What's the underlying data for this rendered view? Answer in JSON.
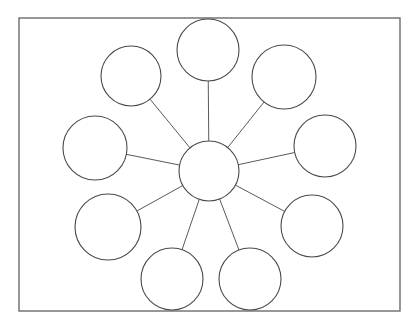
{
  "canvas": {
    "width": 417,
    "height": 325,
    "background_color": "#ffffff"
  },
  "frame": {
    "label": "worksheet-border",
    "x": 19,
    "y": 18,
    "width": 381,
    "height": 293,
    "stroke_color": "#6b6b6b",
    "stroke_width": 1.4,
    "fill": "none"
  },
  "style": {
    "circle_stroke_color": "#4a4a4a",
    "circle_stroke_width": 1.1,
    "circle_fill": "#ffffff",
    "line_stroke_color": "#5a5a5a",
    "line_stroke_width": 1.0
  },
  "diagram": {
    "type": "spider-web-concept-map",
    "title": "",
    "center_node": {
      "id": "center",
      "label": "",
      "cx": 209,
      "cy": 171,
      "r": 30
    },
    "outer_nodes": [
      {
        "id": "node-top",
        "label": "",
        "cx": 208,
        "cy": 50,
        "r": 31,
        "angle_deg": 270
      },
      {
        "id": "node-top-right",
        "label": "",
        "cx": 284,
        "cy": 77,
        "r": 32,
        "angle_deg": 317
      },
      {
        "id": "node-right",
        "label": "",
        "cx": 325,
        "cy": 146,
        "r": 31,
        "angle_deg": 349
      },
      {
        "id": "node-bottom-right",
        "label": "",
        "cx": 312,
        "cy": 226,
        "r": 31,
        "angle_deg": 29
      },
      {
        "id": "node-bottom-right-inner",
        "label": "",
        "cx": 250,
        "cy": 279,
        "r": 31,
        "angle_deg": 70
      },
      {
        "id": "node-bottom-left-inner",
        "label": "",
        "cx": 172,
        "cy": 279,
        "r": 31,
        "angle_deg": 110
      },
      {
        "id": "node-bottom-left",
        "label": "",
        "cx": 108,
        "cy": 227,
        "r": 33,
        "angle_deg": 151
      },
      {
        "id": "node-left",
        "label": "",
        "cx": 95,
        "cy": 148,
        "r": 32,
        "angle_deg": 192
      },
      {
        "id": "node-top-left",
        "label": "",
        "cx": 131,
        "cy": 76,
        "r": 30,
        "angle_deg": 232
      }
    ],
    "connections": [
      {
        "from": "center",
        "to": "node-top"
      },
      {
        "from": "center",
        "to": "node-top-right"
      },
      {
        "from": "center",
        "to": "node-right"
      },
      {
        "from": "center",
        "to": "node-bottom-right"
      },
      {
        "from": "center",
        "to": "node-bottom-right-inner"
      },
      {
        "from": "center",
        "to": "node-bottom-left-inner"
      },
      {
        "from": "center",
        "to": "node-bottom-left"
      },
      {
        "from": "center",
        "to": "node-left"
      },
      {
        "from": "center",
        "to": "node-top-left"
      }
    ],
    "outer_node_count": 9,
    "total_node_count": 10,
    "connection_count": 9
  }
}
